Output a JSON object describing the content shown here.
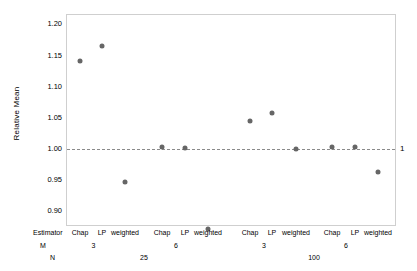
{
  "chart_data": {
    "type": "scatter",
    "title": "",
    "xlabel": "",
    "ylabel": "Relative Mean",
    "ylim": [
      0.875,
      1.215
    ],
    "yticks": [
      "1.20",
      "1.15",
      "1.10",
      "1.05",
      "1.00",
      "0.95",
      "0.90"
    ],
    "ytick_values": [
      1.2,
      1.15,
      1.1,
      1.05,
      1.0,
      0.95,
      0.9
    ],
    "grid": false,
    "legend": "none",
    "reference_line": {
      "value": 1.0,
      "label": "1",
      "style": "dashed"
    },
    "categories": [
      "Chap",
      "LP",
      "weighted",
      "Chap",
      "LP",
      "weighted",
      "Chap",
      "LP",
      "weighted",
      "Chap",
      "LP",
      "weighted"
    ],
    "values": [
      1.14,
      1.163,
      0.945,
      1.001,
      1.0,
      0.87,
      1.044,
      1.057,
      0.998,
      1.001,
      1.001,
      0.962
    ],
    "group_rows": {
      "estimator_key": "Estimator",
      "m_key": "M",
      "n_key": "N",
      "m_groups": [
        {
          "label": "3",
          "span": [
            0,
            2
          ]
        },
        {
          "label": "6",
          "span": [
            3,
            5
          ]
        },
        {
          "label": "3",
          "span": [
            6,
            8
          ]
        },
        {
          "label": "6",
          "span": [
            9,
            11
          ]
        }
      ],
      "n_groups": [
        {
          "label": "25",
          "span": [
            0,
            5
          ]
        },
        {
          "label": "100",
          "span": [
            6,
            11
          ]
        }
      ]
    },
    "colors": {
      "point": "#666666",
      "refline": "#8a8a8a",
      "frame": "#cfcfcf",
      "text": "#000000"
    }
  }
}
